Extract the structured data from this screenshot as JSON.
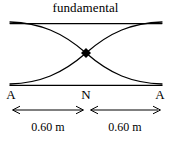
{
  "figure": {
    "title": "fundamental",
    "background_color": "#ffffff",
    "ink_color": "#000000",
    "width": 171,
    "height": 143
  },
  "diagram": {
    "type": "standing-wave-envelope",
    "node_marker": "filled-diamond",
    "string_span_px": [
      10,
      162
    ],
    "envelope_top_y_px": 22,
    "envelope_bottom_y_px": 84,
    "node_x_px": 86,
    "node_y_px": 53
  },
  "labels": {
    "antinode_left": "A",
    "node_center": "N",
    "antinode_right": "A"
  },
  "dimensions": [
    {
      "id": "left-segment",
      "value": "0.60 m",
      "arrow": "double-headed"
    },
    {
      "id": "right-segment",
      "value": "0.60 m",
      "arrow": "double-headed"
    }
  ]
}
